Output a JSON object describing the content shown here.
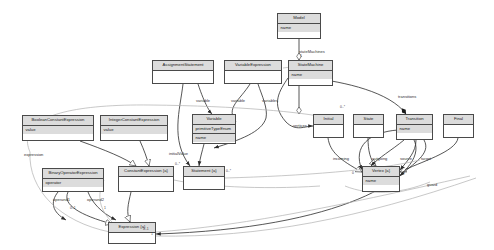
{
  "diagram": {
    "type": "uml-class-diagram",
    "colors": {
      "node_header": "#dcdcdc",
      "node_border": "#4a4a4a",
      "edge": "#2b2b2b",
      "edge_light": "#b4b4b4",
      "background": "#ffffff",
      "text": "#1a1a1a"
    }
  },
  "nodes": [
    {
      "id": "model",
      "name": "Model",
      "attrs": [
        "name"
      ],
      "x": 277,
      "y": 13,
      "w": 44,
      "h": 26
    },
    {
      "id": "assignment",
      "name": "AssignmentStatement",
      "attrs": [],
      "x": 152,
      "y": 60,
      "w": 62,
      "h": 24
    },
    {
      "id": "varexpr",
      "name": "VariableExpression",
      "attrs": [],
      "x": 224,
      "y": 60,
      "w": 58,
      "h": 24
    },
    {
      "id": "statemachine",
      "name": "StateMachine",
      "attrs": [
        "name"
      ],
      "x": 288,
      "y": 60,
      "w": 45,
      "h": 26
    },
    {
      "id": "boolconst",
      "name": "BooleanConstantExpression",
      "attrs": [
        "value"
      ],
      "x": 22,
      "y": 115,
      "w": 72,
      "h": 26
    },
    {
      "id": "intconst",
      "name": "IntegerConstantExpression",
      "attrs": [
        "value"
      ],
      "x": 100,
      "y": 115,
      "w": 68,
      "h": 26
    },
    {
      "id": "variable",
      "name": "Variable",
      "attrs": [
        "primitiveTypeEnum",
        "name"
      ],
      "x": 192,
      "y": 114,
      "w": 44,
      "h": 30
    },
    {
      "id": "initial",
      "name": "Initial",
      "attrs": [],
      "x": 313,
      "y": 114,
      "w": 31,
      "h": 24
    },
    {
      "id": "state",
      "name": "State",
      "attrs": [],
      "x": 353,
      "y": 114,
      "w": 31,
      "h": 24
    },
    {
      "id": "transition",
      "name": "Transition",
      "attrs": [
        "name"
      ],
      "x": 396,
      "y": 114,
      "w": 37,
      "h": 26
    },
    {
      "id": "final",
      "name": "Final",
      "attrs": [],
      "x": 443,
      "y": 114,
      "w": 31,
      "h": 24
    },
    {
      "id": "binop",
      "name": "BinaryOperatorExpression",
      "attrs": [
        "operator"
      ],
      "x": 42,
      "y": 168,
      "w": 62,
      "h": 24
    },
    {
      "id": "constexpr",
      "name": "ConstantExpression {a}",
      "attrs": [],
      "x": 118,
      "y": 166,
      "w": 56,
      "h": 26
    },
    {
      "id": "statement",
      "name": "Statement {a}",
      "attrs": [],
      "x": 183,
      "y": 166,
      "w": 42,
      "h": 24
    },
    {
      "id": "vertex",
      "name": "Vertex {a}",
      "attrs": [
        "name"
      ],
      "x": 362,
      "y": 166,
      "w": 38,
      "h": 26
    },
    {
      "id": "expression",
      "name": "Expression {a}",
      "attrs": [],
      "x": 108,
      "y": 222,
      "w": 48,
      "h": 22
    }
  ],
  "edge_labels": [
    {
      "id": "stateMachines",
      "text": "stateMachines",
      "x": 299,
      "y": 50
    },
    {
      "id": "variable_a",
      "text": "variable",
      "x": 196,
      "y": 99
    },
    {
      "id": "variable_b",
      "text": "variable",
      "x": 231,
      "y": 99
    },
    {
      "id": "variables",
      "text": "variables",
      "x": 262,
      "y": 99
    },
    {
      "id": "transitions",
      "text": "transitions",
      "x": 398,
      "y": 95
    },
    {
      "id": "vertices",
      "text": "vertices",
      "x": 293,
      "y": 124
    },
    {
      "id": "expression",
      "text": "expression",
      "x": 24,
      "y": 153
    },
    {
      "id": "initialValue",
      "text": "initialValue",
      "x": 169,
      "y": 152
    },
    {
      "id": "incoming",
      "text": "incoming",
      "x": 333,
      "y": 157
    },
    {
      "id": "outgoing",
      "text": "outgoing",
      "x": 372,
      "y": 157
    },
    {
      "id": "source",
      "text": "source",
      "x": 400,
      "y": 157
    },
    {
      "id": "target",
      "text": "target",
      "x": 421,
      "y": 157
    },
    {
      "id": "guard",
      "text": "guard",
      "x": 427,
      "y": 183
    },
    {
      "id": "operand1",
      "text": "operand1",
      "x": 53,
      "y": 198
    },
    {
      "id": "operand2",
      "text": "operand2",
      "x": 87,
      "y": 198
    }
  ],
  "multiplicities": [
    {
      "id": "m1",
      "text": "1",
      "x": 300,
      "y": 55
    },
    {
      "id": "m2",
      "text": "0..*",
      "x": 340,
      "y": 106
    },
    {
      "id": "m3",
      "text": "0..*",
      "x": 175,
      "y": 163
    },
    {
      "id": "m4",
      "text": "0..*",
      "x": 226,
      "y": 170
    },
    {
      "id": "m5",
      "text": "0",
      "x": 352,
      "y": 172
    },
    {
      "id": "m6",
      "text": "1",
      "x": 403,
      "y": 172
    },
    {
      "id": "m7",
      "text": "0..1",
      "x": 70,
      "y": 207
    },
    {
      "id": "m8",
      "text": "1",
      "x": 104,
      "y": 207
    },
    {
      "id": "m9",
      "text": "0..1",
      "x": 143,
      "y": 228
    },
    {
      "id": "m10",
      "text": "1",
      "x": 151,
      "y": 233
    }
  ]
}
